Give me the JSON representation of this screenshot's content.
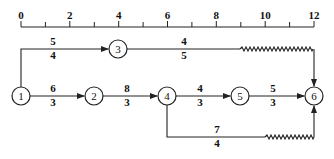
{
  "diagram": {
    "type": "time-scaled network diagram",
    "colors": {
      "line": "#222222",
      "background": "#ffffff"
    },
    "time_scale": {
      "ticks": [
        "0",
        "2",
        "4",
        "6",
        "8",
        "10",
        "12"
      ],
      "min": 0,
      "max": 12,
      "minor_step": 1
    },
    "nodes": [
      {
        "id": "1",
        "label": "1",
        "time": 0
      },
      {
        "id": "2",
        "label": "2",
        "time": 3
      },
      {
        "id": "3",
        "label": "3",
        "time": 4
      },
      {
        "id": "4",
        "label": "4",
        "time": 6
      },
      {
        "id": "5",
        "label": "5",
        "time": 9
      },
      {
        "id": "6",
        "label": "6",
        "time": 12
      }
    ],
    "edges": [
      {
        "from": "1",
        "to": "3",
        "top": "5",
        "bottom": "4"
      },
      {
        "from": "3",
        "to": "6",
        "top": "4",
        "bottom": "5",
        "free_float_wave": true
      },
      {
        "from": "1",
        "to": "2",
        "top": "6",
        "bottom": "3"
      },
      {
        "from": "2",
        "to": "4",
        "top": "8",
        "bottom": "3"
      },
      {
        "from": "4",
        "to": "5",
        "top": "4",
        "bottom": "3"
      },
      {
        "from": "5",
        "to": "6",
        "top": "5",
        "bottom": "3"
      },
      {
        "from": "4",
        "to": "6",
        "top": "7",
        "bottom": "4",
        "free_float_wave": true
      }
    ]
  }
}
